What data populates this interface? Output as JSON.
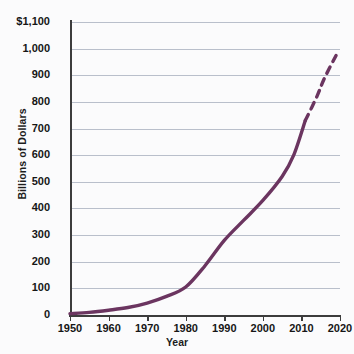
{
  "chart_data": {
    "type": "line",
    "title": "",
    "xlabel": "Year",
    "ylabel": "Billions of Dollars",
    "xlim": [
      1950,
      2020
    ],
    "ylim": [
      0,
      1100
    ],
    "grid": true,
    "legend": "none",
    "x_tick_labels": [
      "1950",
      "1960",
      "1970",
      "1980",
      "1990",
      "2000",
      "2010",
      "2020"
    ],
    "x_ticks": [
      1950,
      1960,
      1970,
      1980,
      1990,
      2000,
      2010,
      2020
    ],
    "y_tick_labels": [
      "0",
      "100",
      "200",
      "300",
      "400",
      "500",
      "600",
      "700",
      "800",
      "900",
      "1,000",
      "$1,100"
    ],
    "y_ticks": [
      0,
      100,
      200,
      300,
      400,
      500,
      600,
      700,
      800,
      900,
      1000,
      1100
    ],
    "line_color": "#6b3560",
    "series": [
      {
        "name": "actual",
        "style": "solid",
        "x": [
          1950,
          1955,
          1960,
          1965,
          1970,
          1975,
          1980,
          1985,
          1990,
          1995,
          2000,
          2005,
          2008,
          2011
        ],
        "values": [
          5,
          10,
          18,
          28,
          45,
          70,
          105,
          185,
          280,
          355,
          430,
          520,
          600,
          730
        ]
      },
      {
        "name": "projected",
        "style": "dashed",
        "x": [
          2011,
          2014,
          2016,
          2019
        ],
        "values": [
          730,
          820,
          890,
          975
        ]
      }
    ],
    "annotations": []
  }
}
